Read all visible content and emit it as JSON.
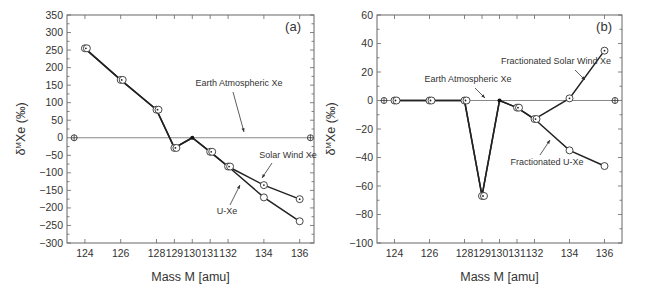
{
  "figure": {
    "panels": [
      {
        "id": "a",
        "panel_label": "(a)",
        "xlabel": "Mass M [amu]",
        "ylabel": "δMXe (‰)",
        "x_ticks": [
          124,
          126,
          128,
          129,
          130,
          131,
          132,
          134,
          136
        ],
        "y_ticks": [
          350,
          300,
          250,
          200,
          150,
          100,
          50,
          0,
          -50,
          -100,
          -150,
          -200,
          -250,
          -300
        ],
        "annotations": {
          "earth": "Earth Atmospheric Xe",
          "sw": "Solar Wind Xe",
          "uxe": "U-Xe"
        }
      },
      {
        "id": "b",
        "panel_label": "(b)",
        "xlabel": "Mass M [amu]",
        "ylabel": "δMXe (‰)",
        "x_ticks": [
          124,
          126,
          128,
          129,
          130,
          131,
          132,
          134,
          136
        ],
        "y_ticks": [
          60,
          40,
          20,
          0,
          -20,
          -40,
          -60,
          -80,
          -100
        ],
        "annotations": {
          "earth": "Earth Atmospheric Xe",
          "sw": "Fractionated Solar Wind Xe",
          "uxe": "Fractionated U-Xe"
        }
      }
    ]
  },
  "chart_data": [
    {
      "type": "line",
      "title": "(a)",
      "xlabel": "Mass M [amu]",
      "ylabel": "δMXe (‰)",
      "xlim": [
        123,
        136.8
      ],
      "ylim": [
        -300,
        350
      ],
      "grid": false,
      "series": [
        {
          "name": "Earth Atmospheric Xe",
          "x": [
            123.4,
            136.6
          ],
          "values": [
            0,
            0
          ]
        },
        {
          "name": "Solar Wind Xe",
          "x": [
            124,
            126,
            128,
            129,
            130,
            131,
            132,
            134,
            136
          ],
          "values": [
            255,
            165,
            80,
            -29,
            0,
            -40,
            -82,
            -135,
            -175
          ]
        },
        {
          "name": "U-Xe",
          "x": [
            124,
            126,
            128,
            129,
            130,
            131,
            132,
            134,
            136
          ],
          "values": [
            255,
            165,
            80,
            -29,
            0,
            -40,
            -82,
            -170,
            -238
          ]
        }
      ]
    },
    {
      "type": "line",
      "title": "(b)",
      "xlabel": "Mass M [amu]",
      "ylabel": "δMXe (‰)",
      "xlim": [
        123,
        137
      ],
      "ylim": [
        -100,
        60
      ],
      "grid": false,
      "series": [
        {
          "name": "Earth Atmospheric Xe",
          "x": [
            123.4,
            136.6
          ],
          "values": [
            0,
            0
          ]
        },
        {
          "name": "Fractionated Solar Wind Xe",
          "x": [
            124,
            126,
            128,
            129,
            130,
            131,
            132,
            134,
            136
          ],
          "values": [
            0,
            0,
            0,
            -67,
            0,
            -5,
            -13,
            1.5,
            35
          ]
        },
        {
          "name": "Fractionated U-Xe",
          "x": [
            124,
            126,
            128,
            129,
            130,
            131,
            132,
            134,
            136
          ],
          "values": [
            0,
            0,
            0,
            -67,
            0,
            -5,
            -13,
            -35,
            -46
          ]
        }
      ]
    }
  ]
}
